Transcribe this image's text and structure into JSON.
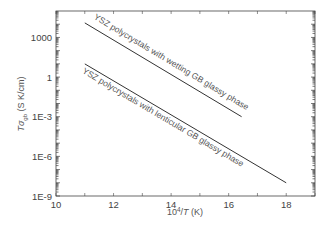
{
  "chart_data": {
    "type": "line",
    "title": "",
    "xlabel": "10^4/T (K)",
    "xlabel_parts": {
      "base": "10",
      "sup": "4",
      "rest": "/",
      "italic": "T",
      "unit": " (K)"
    },
    "ylabel": "Tσgb (S K/cm)",
    "ylabel_parts": {
      "italic": "Tσ",
      "sub": "gb",
      "unit": " (S K/cm)"
    },
    "xlim": [
      10,
      19
    ],
    "ylim": [
      1e-09,
      100000.0
    ],
    "yscale": "log",
    "grid": false,
    "legend": "none (inline annotations)",
    "x_ticks": [
      10,
      12,
      14,
      16,
      18
    ],
    "x_tick_labels": [
      "10",
      "12",
      "14",
      "16",
      "18"
    ],
    "y_ticks": [
      1000,
      1,
      0.001,
      1e-06,
      1e-09
    ],
    "y_tick_labels": [
      "1000",
      "1",
      "1E-3",
      "1E-6",
      "1E-9"
    ],
    "series": [
      {
        "name": "YSZ polycrystals with wetting GB glassy phase",
        "x": [
          11.0,
          16.45
        ],
        "log10_y": [
          4.1,
          -3.0
        ],
        "values": [
          12000,
          0.001
        ]
      },
      {
        "name": "YSZ polycrystals with lenticular GB glassy phase",
        "x": [
          11.0,
          18.0
        ],
        "log10_y": [
          1.0,
          -8.0
        ],
        "values": [
          10,
          1e-08
        ]
      }
    ],
    "annotations": [
      {
        "text": "YSZ polycrystals with wetting GB glassy phase",
        "position": "above upper line"
      },
      {
        "text": "YSZ polycrystals with lenticular GB glassy phase",
        "position": "below lower line"
      }
    ]
  },
  "style": {
    "line_color": "#333333",
    "axis_color": "#444444",
    "text_color": "#555555"
  }
}
